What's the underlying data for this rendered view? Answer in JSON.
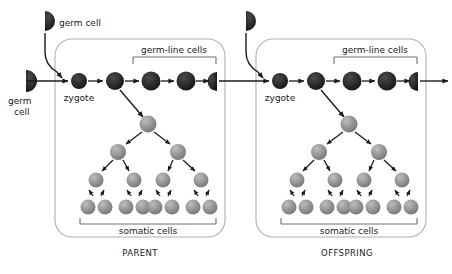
{
  "figure": {
    "type": "biology-diagram",
    "background": "#ffffff"
  },
  "colors": {
    "germ_cell_dark": "#2b2b2b",
    "somatic_gray": "#8f8f8f",
    "somatic_gray_light": "#a8a8a8",
    "panel_border": "#b0b0b0",
    "arrow": "#1a1a1a",
    "bracket": "#6e6e6e",
    "text": "#1a1a1a"
  },
  "labels": {
    "germ_cell_top_left": "germ cell",
    "germ_cell_left_line1": "germ",
    "germ_cell_left_line2": "cell",
    "zygote": "zygote",
    "germ_line_cells": "germ-line cells",
    "somatic_cells": "somatic cells",
    "parent": "PARENT",
    "offspring": "OFFSPRING"
  },
  "panels": [
    {
      "name": "parent",
      "caption": "PARENT",
      "germ_line_label": "germ-line cells",
      "somatic_label": "somatic cells",
      "zygote_label": "zygote",
      "germline_cell_count": 5,
      "germline_last_is_half": true,
      "somatic_tree_levels": [
        1,
        2,
        4,
        8
      ]
    },
    {
      "name": "offspring",
      "caption": "OFFSPRING",
      "germ_line_label": "germ-line cells",
      "somatic_label": "somatic cells",
      "zygote_label": "zygote",
      "germline_cell_count": 5,
      "germline_last_is_half": true,
      "somatic_tree_levels": [
        1,
        2,
        4,
        8
      ]
    }
  ],
  "external_germ_cells": [
    {
      "name": "top-left-germ-cell",
      "label": "germ cell",
      "shape": "half-circle-right"
    },
    {
      "name": "left-germ-cell",
      "label": "germ cell",
      "shape": "half-circle-right"
    },
    {
      "name": "top-right-germ-cell",
      "label": "",
      "shape": "half-circle-right"
    }
  ]
}
